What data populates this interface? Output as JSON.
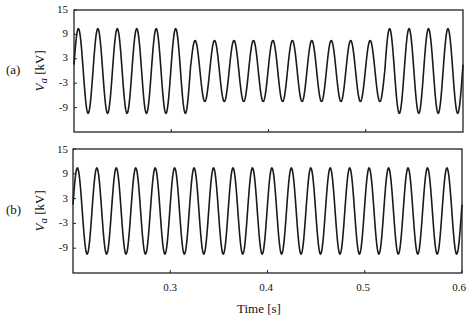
{
  "chart_data": [
    {
      "type": "line",
      "panel_label": "(a)",
      "title": "",
      "ylabel_var": "V",
      "ylabel_sub": "a",
      "ylabel_unit": " [kV]",
      "xlabel": "",
      "xlim": [
        0.2,
        0.6
      ],
      "ylim": [
        -15,
        15
      ],
      "yticks": [
        15,
        9,
        3,
        -3,
        -9
      ],
      "xticks": [
        0.3,
        0.4,
        0.5
      ],
      "grid": false,
      "series": [
        {
          "name": "Va (a)",
          "frequency_hz": 50,
          "segments": [
            {
              "t_start": 0.2,
              "t_end": 0.32,
              "amplitude_kv": 10.4
            },
            {
              "t_start": 0.32,
              "t_end": 0.52,
              "amplitude_kv": 7.5
            },
            {
              "t_start": 0.52,
              "t_end": 0.6,
              "amplitude_kv": 10.4
            }
          ]
        }
      ]
    },
    {
      "type": "line",
      "panel_label": "(b)",
      "title": "",
      "ylabel_var": "V",
      "ylabel_sub": "a",
      "ylabel_unit": " [kV]",
      "xlabel": "Time [s]",
      "xlim": [
        0.2,
        0.6
      ],
      "ylim": [
        -15,
        15
      ],
      "yticks": [
        15,
        9,
        3,
        -3,
        -9
      ],
      "xticks": [
        0.3,
        0.4,
        0.5,
        0.6
      ],
      "grid": false,
      "series": [
        {
          "name": "Va (b)",
          "frequency_hz": 50,
          "segments": [
            {
              "t_start": 0.2,
              "t_end": 0.6,
              "amplitude_kv": 10.4
            }
          ]
        }
      ]
    }
  ],
  "labels": {
    "panel_a": "(a)",
    "panel_b": "(b)",
    "y_var": "V",
    "y_sub": "a",
    "y_unit": " [kV]",
    "x_axis": "Time [s]",
    "yticks": [
      "15",
      "9",
      "3",
      "-3",
      "-9"
    ],
    "xticks": [
      "0.3",
      "0.4",
      "0.5",
      "0.6"
    ]
  }
}
